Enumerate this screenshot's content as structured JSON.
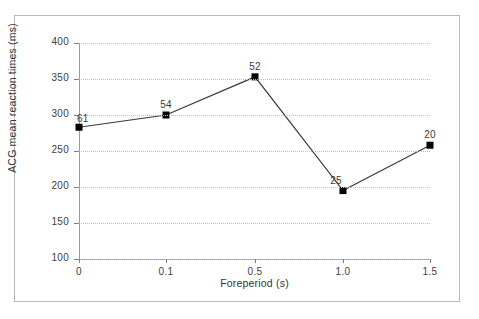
{
  "chart_data": {
    "type": "line",
    "title": "",
    "xlabel": "Foreperiod (s)",
    "ylabel": "ACG mean reaction times (ms)",
    "categories": [
      "0",
      "0.1",
      "0.5",
      "1.0",
      "1.5"
    ],
    "x_positions": [
      0,
      0.1,
      0.5,
      1.0,
      1.5
    ],
    "values": [
      283,
      300,
      353,
      195,
      258
    ],
    "point_labels": [
      "61",
      "54",
      "52",
      "25",
      "20"
    ],
    "ylim": [
      100,
      400
    ],
    "y_ticks": [
      "400",
      "350",
      "300",
      "250",
      "200",
      "150",
      "100"
    ],
    "y_tick_values": [
      400,
      350,
      300,
      250,
      200,
      150,
      100
    ],
    "grid": true,
    "legend": "none",
    "marker": "square",
    "series": [
      {
        "name": "ACG mean reaction times",
        "values": [
          283,
          300,
          353,
          195,
          258
        ]
      }
    ],
    "colors": {
      "line": "#3a3a3a",
      "marker": "#000000",
      "grid": "#bdbdbd",
      "axis": "#9a9a9a",
      "text": "#333333",
      "frame": "#b9b9b9",
      "background": "#ffffff"
    }
  }
}
